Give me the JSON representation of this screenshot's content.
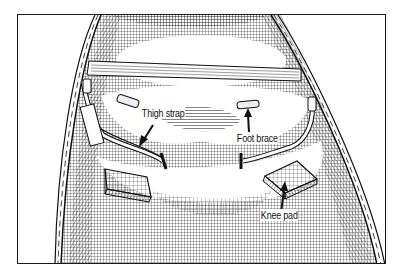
{
  "figure": {
    "labels": [
      {
        "id": "thigh-strap",
        "text": "Thigh strap"
      },
      {
        "id": "foot-brace",
        "text": "Foot brace"
      },
      {
        "id": "knee-pad",
        "text": "Knee pad"
      }
    ],
    "colors": {
      "ink": "#111111",
      "paper": "#ffffff"
    }
  }
}
